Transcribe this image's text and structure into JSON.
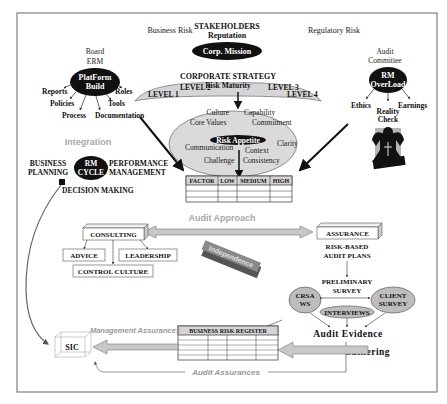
{
  "header": {
    "stakeholders": "STAKEHOLDERS",
    "reputation": "Reputation",
    "business_risk": "Business Risk",
    "regulatory_risk": "Regulatory Risk",
    "corp_mission": "Corp. Mission"
  },
  "board": {
    "title_line1": "Board",
    "title_line2": "ERM",
    "node_line1": "PlatForm",
    "node_line2": "Build",
    "branches": [
      "Reports",
      "Policies",
      "Process",
      "Documentation",
      "Tools",
      "Roles"
    ]
  },
  "audit_committee": {
    "title_line1": "Audit",
    "title_line2": "Committee",
    "node_line1": "RM",
    "node_line2": "OverLoad",
    "branches": [
      "Ethics",
      "Reality",
      "Check",
      "Earnings"
    ]
  },
  "strategy": {
    "title": "CORPORATE STRATEGY",
    "levels": [
      "LEVEL 1",
      "LEVEL 2",
      "LEVEL 3",
      "LEVEL 4"
    ],
    "center": "Risk Maturity"
  },
  "appetite": {
    "center": "Risk Appetite",
    "words": [
      "Culture",
      "Capability",
      "Core Values",
      "Commitment",
      "Communication",
      "Context",
      "Clarity",
      "Challenge",
      "Consistency"
    ]
  },
  "factor_table": {
    "headers": [
      "FACTOR",
      "LOW",
      "MEDIUM",
      "HIGH"
    ],
    "rows": 3
  },
  "integration": {
    "label": "Integration",
    "node_line1": "RM",
    "node_line2": "CYCLE",
    "left_line1": "BUSINESS",
    "left_line2": "PLANNING",
    "right_line1": "PERFORMANCE",
    "right_line2": "MANAGEMENT",
    "bottom": "DECISION MAKING"
  },
  "audit_approach": {
    "label": "Audit Approach",
    "independence": "Independence"
  },
  "consulting": {
    "title": "CONSULTING",
    "children": [
      "ADVICE",
      "LEADERSHIP",
      "CONTROL CULTURE"
    ]
  },
  "assurance": {
    "title": "ASSURANCE",
    "subtitle_line1": "RISK-BASED",
    "subtitle_line2": "AUDIT PLANS",
    "survey_line1": "PRELIMINARY",
    "survey_line2": "SURVEY",
    "crsa_line1": "CRSA",
    "crsa_line2": "WS",
    "client_line1": "CLIENT",
    "client_line2": "SURVEY",
    "interviews": "INTERVIEWS",
    "evidence": "Audit Evidence",
    "gathering": "Gathering"
  },
  "register": {
    "title": "BUSINESS RISK REGISTER",
    "rows": 5,
    "cols": 4
  },
  "sic": {
    "label": "SIC",
    "management_assurances": "Management Assurances",
    "audit_assurances": "Audit Assurances"
  },
  "colors": {
    "frame": "#555555",
    "node_fill": "#111111",
    "ellipse_fill": "#d8d8d8",
    "arrow_fill": "#c8c8c8",
    "faded_text": "#9a9a9a"
  }
}
